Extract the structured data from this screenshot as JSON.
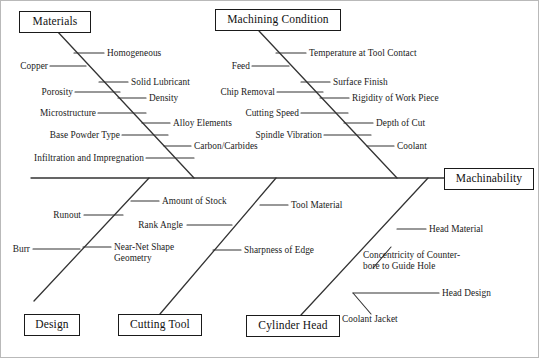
{
  "diagram": {
    "type": "fishbone-ishikawa",
    "effect": "Machinability",
    "categories": [
      {
        "name": "Materials",
        "position": "top-left",
        "causes": [
          "Homogeneous",
          "Copper",
          "Solid Lubricant",
          "Porosity",
          "Density",
          "Microstructure",
          "Alloy Elements",
          "Base Powder Type",
          "Carbon/Carbides",
          "Infiltration and Impregnation"
        ]
      },
      {
        "name": "Machining Condition",
        "position": "top-right",
        "causes": [
          "Temperature at Tool Contact",
          "Feed",
          "Surface Finish",
          "Chip Removal",
          "Rigidity of Work Piece",
          "Cutting Speed",
          "Depth of Cut",
          "Spindle Vibration",
          "Coolant"
        ]
      },
      {
        "name": "Design",
        "position": "bottom-left",
        "causes": [
          "Amount of Stock",
          "Runout",
          "Burr",
          "Near-Net Shape\nGeometry"
        ]
      },
      {
        "name": "Cutting Tool",
        "position": "bottom-center",
        "causes": [
          "Tool Material",
          "Rank Angle",
          "Sharpness of Edge"
        ]
      },
      {
        "name": "Cylinder Head",
        "position": "bottom-right",
        "causes": [
          "Head Material",
          "Concentricity of Counter-\nbore to Guide Hole",
          "Head Design",
          "Coolant Jacket"
        ]
      }
    ]
  },
  "labels": {
    "materials": "Materials",
    "machining_condition": "Machining Condition",
    "design": "Design",
    "cutting_tool": "Cutting Tool",
    "cylinder_head": "Cylinder Head",
    "machinability": "Machinability",
    "homogeneous": "Homogeneous",
    "copper": "Copper",
    "solid_lubricant": "Solid Lubricant",
    "porosity": "Porosity",
    "density": "Density",
    "microstructure": "Microstructure",
    "alloy_elements": "Alloy Elements",
    "base_powder_type": "Base Powder Type",
    "carbon_carbides": "Carbon/Carbides",
    "infiltration": "Infiltration and Impregnation",
    "temperature_tool_contact": "Temperature at Tool Contact",
    "feed": "Feed",
    "surface_finish": "Surface Finish",
    "chip_removal": "Chip Removal",
    "rigidity_work_piece": "Rigidity of Work Piece",
    "cutting_speed": "Cutting Speed",
    "depth_of_cut": "Depth of Cut",
    "spindle_vibration": "Spindle Vibration",
    "coolant": "Coolant",
    "amount_of_stock": "Amount of Stock",
    "runout": "Runout",
    "burr": "Burr",
    "near_net_shape": "Near-Net Shape",
    "geometry": "Geometry",
    "tool_material": "Tool Material",
    "rank_angle": "Rank Angle",
    "sharpness_of_edge": "Sharpness of Edge",
    "head_material": "Head Material",
    "concentricity_1": "Concentricity of Counter-",
    "concentricity_2": "bore to Guide Hole",
    "head_design": "Head Design",
    "coolant_jacket": "Coolant Jacket"
  },
  "colors": {
    "line": "#333333",
    "box_border": "#1a1a1a",
    "text": "#1a1a1a",
    "background": "#ffffff"
  }
}
